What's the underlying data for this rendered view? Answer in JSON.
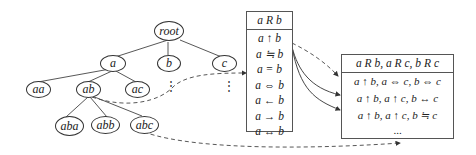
{
  "tree": {
    "nodes": [
      {
        "id": "root",
        "label": "root"
      },
      {
        "id": "a",
        "label": "a"
      },
      {
        "id": "b",
        "label": "b"
      },
      {
        "id": "c",
        "label": "c"
      },
      {
        "id": "aa",
        "label": "aa"
      },
      {
        "id": "ab",
        "label": "ab"
      },
      {
        "id": "ac",
        "label": "ac"
      },
      {
        "id": "aba",
        "label": "aba"
      },
      {
        "id": "abb",
        "label": "abb"
      },
      {
        "id": "abc",
        "label": "abc"
      }
    ],
    "ellipsis": "⋮"
  },
  "relation_table": {
    "header": "a R b",
    "rows": [
      "a ↑ b",
      "a ≒ b",
      "a = b",
      "a ⇔ b",
      "a ← b",
      "a → b",
      "a ↔ b"
    ]
  },
  "triple_table": {
    "header": "a R b, a R c, b R c",
    "rows": [
      "a ↑ b, a ⇔ c, b ⇔ c",
      "a ↑ b, a ↑ c, b ↔ c",
      "a ↑ b, a ↑ c, b ≒ c"
    ],
    "ellipsis": "..."
  }
}
